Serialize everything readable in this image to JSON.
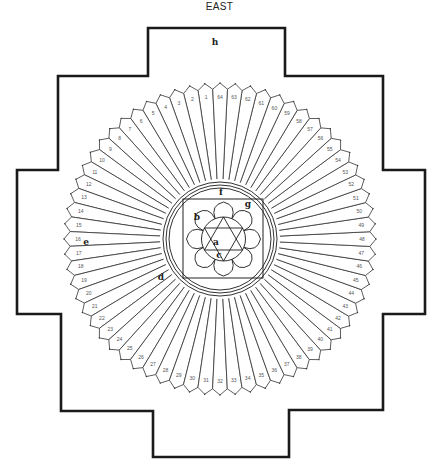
{
  "diagram": {
    "direction_label": "EAST",
    "colors": {
      "ink": "#1a1a1a",
      "petal_line": "#333333",
      "number": "#555555",
      "background": "#ffffff"
    },
    "center": {
      "x": 220,
      "y": 239
    },
    "frame": {
      "points": [
        [
          148,
          28
        ],
        [
          285,
          28
        ],
        [
          285,
          76
        ],
        [
          383,
          76
        ],
        [
          383,
          170
        ],
        [
          425,
          170
        ],
        [
          425,
          314
        ],
        [
          383,
          314
        ],
        [
          383,
          410
        ],
        [
          289,
          410
        ],
        [
          289,
          457
        ],
        [
          153,
          457
        ],
        [
          153,
          411
        ],
        [
          61,
          411
        ],
        [
          61,
          314
        ],
        [
          17,
          314
        ],
        [
          17,
          170
        ],
        [
          58,
          170
        ],
        [
          58,
          76
        ],
        [
          148,
          76
        ]
      ]
    },
    "petal_ring": {
      "count": 64,
      "inner_radius": 60,
      "outer_radius": 150,
      "tip_radius": 156,
      "first_petal_angle_deg": -95.6,
      "direction": "counterclockwise",
      "numbers": [
        1,
        2,
        3,
        4,
        5,
        6,
        7,
        8,
        9,
        10,
        11,
        12,
        13,
        14,
        15,
        16,
        17,
        18,
        19,
        20,
        21,
        22,
        23,
        24,
        25,
        26,
        27,
        28,
        29,
        30,
        31,
        32,
        33,
        34,
        35,
        36,
        37,
        38,
        39,
        40,
        41,
        42,
        43,
        44,
        45,
        46,
        47,
        48,
        49,
        50,
        51,
        52,
        53,
        54,
        55,
        56,
        57,
        58,
        59,
        60,
        61,
        62,
        63,
        64
      ]
    },
    "inner_circles": {
      "radii": [
        57,
        54,
        51
      ]
    },
    "inner_square": {
      "x": 183,
      "y": 199,
      "width": 80,
      "height": 79
    },
    "lotus": {
      "petal_count": 8,
      "inner_radius": 22,
      "outer_radius": 37
    },
    "hexagram": {
      "radius": 22
    },
    "labels": [
      {
        "id": "a",
        "text": "a",
        "x": 216,
        "y": 245
      },
      {
        "id": "b",
        "text": "b",
        "x": 197,
        "y": 220
      },
      {
        "id": "c",
        "text": "c",
        "x": 219,
        "y": 258
      },
      {
        "id": "d",
        "text": "d",
        "x": 161,
        "y": 280
      },
      {
        "id": "e",
        "text": "e",
        "x": 86,
        "y": 245
      },
      {
        "id": "f",
        "text": "f",
        "x": 221,
        "y": 195
      },
      {
        "id": "g",
        "text": "g",
        "x": 248,
        "y": 207
      },
      {
        "id": "h",
        "text": "h",
        "x": 215,
        "y": 45
      }
    ]
  }
}
